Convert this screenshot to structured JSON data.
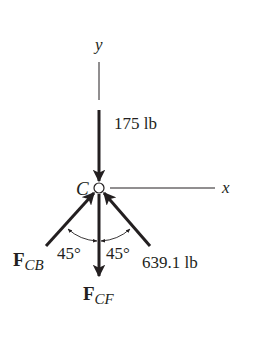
{
  "diagram": {
    "type": "free-body-diagram",
    "joint_label": "C",
    "axes": {
      "x_label": "x",
      "y_label": "y"
    },
    "forces": [
      {
        "name": "applied-load",
        "magnitude_label": "175 lb",
        "direction": "down-into-joint"
      },
      {
        "name": "F_CB",
        "symbol": "F",
        "subscript": "CB",
        "direction": "up-right-into-joint",
        "angle_label": "45°"
      },
      {
        "name": "F_CA",
        "magnitude_label": "639.1 lb",
        "direction": "up-left-into-joint",
        "angle_label": "45°"
      },
      {
        "name": "F_CF",
        "symbol": "F",
        "subscript": "CF",
        "direction": "down-away-from-joint"
      }
    ],
    "colors": {
      "ink": "#231f20",
      "background": "#ffffff"
    }
  }
}
